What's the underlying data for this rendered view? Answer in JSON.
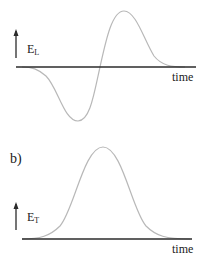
{
  "panels": [
    {
      "id": "a",
      "panel_label": "",
      "quantity_symbol": "E",
      "quantity_subscript": "L",
      "x_axis_label": "time",
      "curve_shape": "antisymmetric derivative-of-gaussian (negative lobe then positive lobe)"
    },
    {
      "id": "b",
      "panel_label": "b)",
      "quantity_symbol": "E",
      "quantity_subscript": "T",
      "x_axis_label": "time",
      "curve_shape": "gaussian pulse (single positive peak)"
    }
  ],
  "colors": {
    "axis": "#2b2b2b",
    "curve": "#b8b8b8",
    "text": "#1a1a1a",
    "background": "#ffffff"
  }
}
